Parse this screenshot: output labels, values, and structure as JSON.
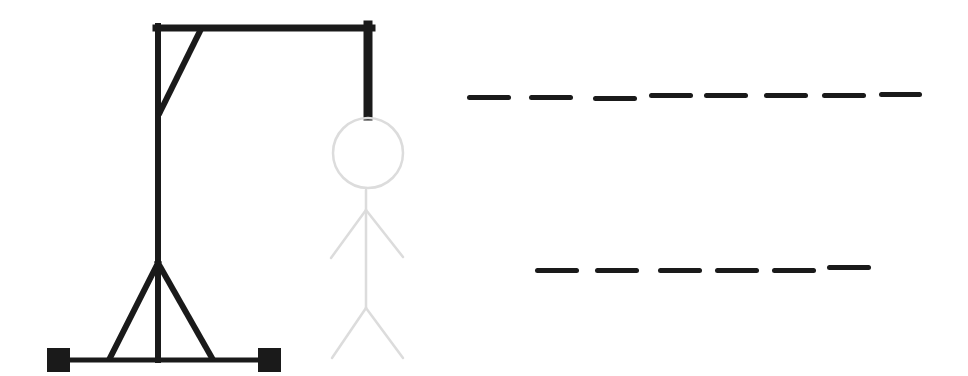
{
  "game": {
    "name": "Hangman",
    "colors": {
      "gallows": "#1a1a1a",
      "figure_hidden": "#dcdcdc",
      "blank": "#1a1a1a",
      "background": "#ffffff"
    },
    "figure_parts": [
      "head",
      "body",
      "left-arm",
      "right-arm",
      "left-leg",
      "right-leg"
    ],
    "figure_parts_revealed": 0,
    "words": [
      {
        "length": 8,
        "letters": [
          "",
          "",
          "",
          "",
          "",
          "",
          "",
          ""
        ]
      },
      {
        "length": 6,
        "letters": [
          "",
          "",
          "",
          "",
          "",
          ""
        ]
      }
    ]
  }
}
